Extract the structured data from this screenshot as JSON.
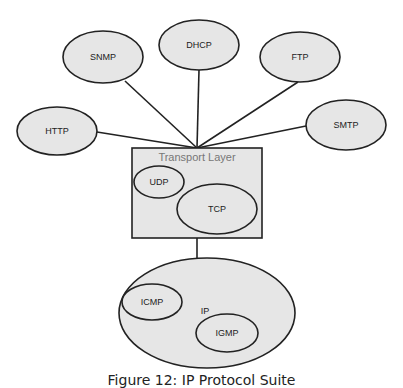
{
  "diagram": {
    "colors": {
      "fill": "#e6e6e6",
      "stroke": "#222222",
      "background": "#ffffff",
      "layer_label": "#777777"
    },
    "application_nodes": [
      {
        "id": "snmp",
        "label": "SNMP",
        "cx": 103,
        "cy": 57,
        "rx": 40,
        "ry": 26,
        "link_x": 125,
        "link_y": 81
      },
      {
        "id": "dhcp",
        "label": "DHCP",
        "cx": 199,
        "cy": 45,
        "rx": 40,
        "ry": 25,
        "link_x": 199,
        "link_y": 70
      },
      {
        "id": "ftp",
        "label": "FTP",
        "cx": 300,
        "cy": 57,
        "rx": 40,
        "ry": 25,
        "link_x": 298,
        "link_y": 82
      },
      {
        "id": "http",
        "label": "HTTP",
        "cx": 57,
        "cy": 131,
        "rx": 40,
        "ry": 24,
        "link_x": 97,
        "link_y": 132
      },
      {
        "id": "smtp",
        "label": "SMTP",
        "cx": 346,
        "cy": 125,
        "rx": 40,
        "ry": 25,
        "link_x": 306,
        "link_y": 126
      }
    ],
    "hub": {
      "x": 197,
      "y": 148
    },
    "transport_layer": {
      "label": "Transport Layer",
      "x": 132,
      "y": 148,
      "width": 130,
      "height": 90,
      "protocols": [
        {
          "id": "udp",
          "label": "UDP",
          "cx": 159,
          "cy": 182,
          "rx": 25,
          "ry": 16
        },
        {
          "id": "tcp",
          "label": "TCP",
          "cx": 217,
          "cy": 209,
          "rx": 40,
          "ry": 25
        }
      ]
    },
    "ip_layer": {
      "label": "IP",
      "cx": 207,
      "cy": 313,
      "rx": 88,
      "ry": 55,
      "protocols": [
        {
          "id": "icmp",
          "label": "ICMP",
          "cx": 152,
          "cy": 302,
          "rx": 30,
          "ry": 18
        },
        {
          "id": "igmp",
          "label": "IGMP",
          "cx": 227,
          "cy": 333,
          "rx": 31,
          "ry": 19
        }
      ]
    },
    "caption": "Figure 12: IP Protocol Suite"
  }
}
